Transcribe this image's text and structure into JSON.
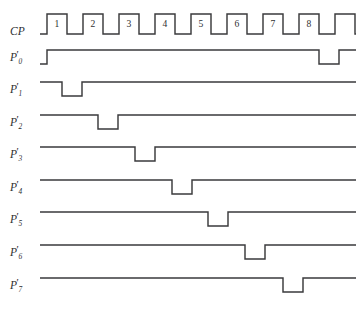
{
  "figure": {
    "type": "timing-diagram",
    "background_color": "#ffffff",
    "line_color": "#3a3a3c",
    "text_color": "#2e2e30",
    "width": 362,
    "height": 319
  },
  "geometry": {
    "label_column_width": 40,
    "trace_start_x": 40,
    "trace_end_x": 356,
    "clock_period_px": 36,
    "pulse_width_px": 20,
    "first_pulse_x": 47,
    "row_pitch_px": 32.4,
    "level_height_px": 14
  },
  "clock": {
    "label": "CP",
    "label_x": 10,
    "label_y": 26,
    "row_top_y": 14,
    "row_bottom_y": 34,
    "pulse_numbers": [
      "1",
      "2",
      "3",
      "4",
      "5",
      "6",
      "7",
      "8"
    ],
    "pulse_start_x": [
      47,
      83,
      119,
      155,
      191,
      227,
      263,
      299
    ],
    "trailing_partial_pulse_x": 335
  },
  "signals": [
    {
      "name": "P0",
      "label_base": "P",
      "label_sub": "0",
      "label_prime": "'",
      "label_x": 10,
      "label_y": 60,
      "row_top_y": 50,
      "row_bottom_y": 64,
      "initial_level": "low",
      "description": "low until first clock, then high, single low pulse at end",
      "transitions": [
        {
          "x": 47,
          "to": "high"
        },
        {
          "x": 319,
          "to": "low"
        },
        {
          "x": 339,
          "to": "high"
        }
      ]
    },
    {
      "name": "P1",
      "label_base": "P",
      "label_sub": "1",
      "label_prime": "'",
      "label_x": 10,
      "label_y": 92,
      "row_top_y": 82,
      "row_bottom_y": 96,
      "initial_level": "high",
      "description": "high with one low pulse during clock 1",
      "transitions": [
        {
          "x": 62,
          "to": "low"
        },
        {
          "x": 82,
          "to": "high"
        }
      ]
    },
    {
      "name": "P2",
      "label_base": "P",
      "label_sub": "2",
      "label_prime": "'",
      "label_x": 10,
      "label_y": 125,
      "row_top_y": 115,
      "row_bottom_y": 129,
      "initial_level": "high",
      "description": "high with one low pulse during clock 2",
      "transitions": [
        {
          "x": 98,
          "to": "low"
        },
        {
          "x": 118,
          "to": "high"
        }
      ]
    },
    {
      "name": "P3",
      "label_base": "P",
      "label_sub": "3",
      "label_prime": "'",
      "label_x": 10,
      "label_y": 157,
      "row_top_y": 147,
      "row_bottom_y": 161,
      "initial_level": "high",
      "description": "high with one low pulse during clock 3",
      "transitions": [
        {
          "x": 135,
          "to": "low"
        },
        {
          "x": 155,
          "to": "high"
        }
      ]
    },
    {
      "name": "P4",
      "label_base": "P",
      "label_sub": "4",
      "label_prime": "'",
      "label_x": 10,
      "label_y": 190,
      "row_top_y": 180,
      "row_bottom_y": 194,
      "initial_level": "high",
      "description": "high with one low pulse during clock 4",
      "transitions": [
        {
          "x": 172,
          "to": "low"
        },
        {
          "x": 192,
          "to": "high"
        }
      ]
    },
    {
      "name": "P5",
      "label_base": "P",
      "label_sub": "5",
      "label_prime": "'",
      "label_x": 10,
      "label_y": 222,
      "row_top_y": 212,
      "row_bottom_y": 226,
      "initial_level": "high",
      "description": "high with one low pulse during clock 5",
      "transitions": [
        {
          "x": 208,
          "to": "low"
        },
        {
          "x": 228,
          "to": "high"
        }
      ]
    },
    {
      "name": "P6",
      "label_base": "P",
      "label_sub": "6",
      "label_prime": "'",
      "label_x": 10,
      "label_y": 255,
      "row_top_y": 245,
      "row_bottom_y": 259,
      "initial_level": "high",
      "description": "high with one low pulse during clock 6",
      "transitions": [
        {
          "x": 245,
          "to": "low"
        },
        {
          "x": 265,
          "to": "high"
        }
      ]
    },
    {
      "name": "P7",
      "label_base": "P",
      "label_sub": "7",
      "label_prime": "'",
      "label_x": 10,
      "label_y": 288,
      "row_top_y": 278,
      "row_bottom_y": 292,
      "initial_level": "high",
      "description": "high with one low pulse during clock 7",
      "transitions": [
        {
          "x": 283,
          "to": "low"
        },
        {
          "x": 303,
          "to": "high"
        }
      ]
    }
  ],
  "chart_data": {
    "type": "line",
    "title": "",
    "xlabel": "",
    "ylabel": "",
    "grid": false,
    "legend": "none",
    "x": [
      1,
      2,
      3,
      4,
      5,
      6,
      7,
      8
    ],
    "categories": [
      "1",
      "2",
      "3",
      "4",
      "5",
      "6",
      "7",
      "8"
    ],
    "series": [
      {
        "name": "CP",
        "values": [
          1,
          1,
          1,
          1,
          1,
          1,
          1,
          1
        ]
      },
      {
        "name": "P0'",
        "values": [
          1,
          1,
          1,
          1,
          1,
          1,
          1,
          1
        ]
      },
      {
        "name": "P1'",
        "values": [
          0,
          1,
          1,
          1,
          1,
          1,
          1,
          1
        ]
      },
      {
        "name": "P2'",
        "values": [
          1,
          0,
          1,
          1,
          1,
          1,
          1,
          1
        ]
      },
      {
        "name": "P3'",
        "values": [
          1,
          1,
          0,
          1,
          1,
          1,
          1,
          1
        ]
      },
      {
        "name": "P4'",
        "values": [
          1,
          1,
          1,
          0,
          1,
          1,
          1,
          1
        ]
      },
      {
        "name": "P5'",
        "values": [
          1,
          1,
          1,
          1,
          0,
          1,
          1,
          1
        ]
      },
      {
        "name": "P6'",
        "values": [
          1,
          1,
          1,
          1,
          1,
          0,
          1,
          1
        ]
      },
      {
        "name": "P7'",
        "values": [
          1,
          1,
          1,
          1,
          1,
          1,
          0,
          1
        ]
      }
    ],
    "ylim": [
      0,
      1
    ]
  }
}
